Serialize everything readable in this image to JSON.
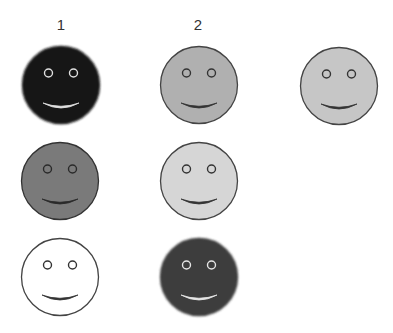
{
  "column_labels": [
    {
      "text": "1",
      "x": 61
    },
    {
      "text": "2",
      "x": 198
    }
  ],
  "faces": [
    {
      "id": "r1c1",
      "row": 1,
      "col": 1,
      "cx": 61,
      "cy": 85,
      "fill": "#141414",
      "stroke": "#141414",
      "features": "#e0e0e0",
      "blur": true
    },
    {
      "id": "r1c2",
      "row": 1,
      "col": 2,
      "cx": 199,
      "cy": 85,
      "fill": "#b0b0b0",
      "stroke": "#444444",
      "features": "#333333",
      "blur": false
    },
    {
      "id": "r1c3",
      "row": 1,
      "col": 3,
      "cx": 339,
      "cy": 86,
      "fill": "#c6c6c6",
      "stroke": "#444444",
      "features": "#333333",
      "blur": false
    },
    {
      "id": "r2c1",
      "row": 2,
      "col": 1,
      "cx": 60,
      "cy": 181,
      "fill": "#7a7a7a",
      "stroke": "#333333",
      "features": "#2a2a2a",
      "blur": false
    },
    {
      "id": "r2c2",
      "row": 2,
      "col": 2,
      "cx": 199,
      "cy": 181,
      "fill": "#d6d6d6",
      "stroke": "#444444",
      "features": "#333333",
      "blur": false
    },
    {
      "id": "r3c1",
      "row": 3,
      "col": 1,
      "cx": 60,
      "cy": 277,
      "fill": "#ffffff",
      "stroke": "#444444",
      "features": "#333333",
      "blur": false
    },
    {
      "id": "r3c2",
      "row": 3,
      "col": 2,
      "cx": 199,
      "cy": 277,
      "fill": "#3c3c3c",
      "stroke": "#3c3c3c",
      "features": "#e6e6e6",
      "blur": true
    }
  ]
}
